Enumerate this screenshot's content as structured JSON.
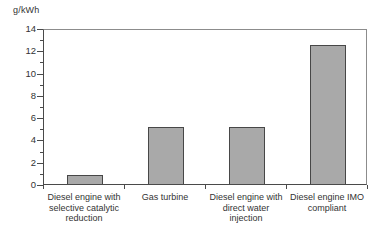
{
  "figure": {
    "background": "#ffffff"
  },
  "chart_data": {
    "type": "bar",
    "title": "",
    "subtitle": "",
    "ylabel": "g/kWh",
    "xlabel": "",
    "ylim": [
      0,
      14
    ],
    "yticks": [
      0,
      2,
      4,
      6,
      8,
      10,
      12,
      14
    ],
    "minor_ytick_interval": 1,
    "categories": [
      "Diesel engine with selective catalytic reduction",
      "Gas turbine",
      "Diesel engine with direct water injection",
      "Diesel engine IMO compliant"
    ],
    "category_label_lines": [
      [
        "Diesel engine with",
        "selective catalytic",
        "reduction"
      ],
      [
        "Gas turbine"
      ],
      [
        "Diesel engine with",
        "direct water",
        "injection"
      ],
      [
        "Diesel engine IMO",
        "compliant"
      ]
    ],
    "values": [
      0.8,
      5.1,
      5.1,
      12.5
    ],
    "grid": false,
    "legend": "none",
    "colors": {
      "bar_fill": "#a9a9a9",
      "bar_border": "#474747",
      "axis": "#4a4a4a",
      "frame": "#8c8c8c",
      "text": "#333333",
      "background": "#ffffff"
    }
  }
}
